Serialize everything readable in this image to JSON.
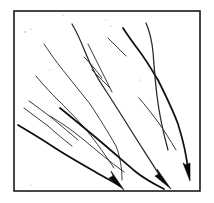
{
  "figure": {
    "background_color": "#ffffff",
    "ink_color": "#262626",
    "frame": {
      "label": "diagram-border",
      "color": "#1a1a1a",
      "stroke_width": 1.6,
      "x": 14,
      "y": 11,
      "width": 186,
      "height": 180
    },
    "networks": [
      {
        "id": "network-left",
        "label": "Left branching network",
        "arrow_label": "arrow-left",
        "arrow_tip": {
          "x": 124,
          "y": 190
        },
        "arrow_angle_deg": 35,
        "branch_count": 5
      },
      {
        "id": "network-center",
        "label": "Center branching network",
        "arrow_label": "arrow-center",
        "arrow_tip": {
          "x": 171,
          "y": 188
        },
        "arrow_angle_deg": 40,
        "branch_count": 6
      },
      {
        "id": "network-right",
        "label": "Right branching network",
        "arrow_label": "arrow-right",
        "arrow_tip": {
          "x": 190,
          "y": 180
        },
        "arrow_angle_deg": 80,
        "branch_count": 4
      }
    ],
    "paths": {
      "left": [
        "M 44 44 C 52 56, 58 64, 66 74 C 74 84, 82 94, 90 104 C 98 116, 108 132, 116 146 C 120 156, 122 168, 122 180",
        "M 36 76 C 44 86, 52 94, 60 102 C 68 110, 78 120, 88 132 C 96 142, 106 156, 114 168",
        "M 29 101 C 36 106, 44 112, 52 118 C 60 125, 70 133, 78 140",
        "M 24 108 C 32 114, 40 120, 48 126 C 56 133, 64 140, 72 146",
        "M 18 125 C 28 131, 40 138, 52 146 C 64 154, 78 162, 92 170 C 102 176, 112 181, 120 186"
      ],
      "center": [
        "M 72 24 C 78 34, 82 44, 86 54 C 90 64, 96 76, 104 88 C 112 100, 122 116, 132 132 C 142 148, 154 166, 164 182",
        "M 88 44 C 92 52, 96 60, 100 68 C 104 76, 108 84, 112 92",
        "M 84 56 C 90 62, 96 70, 102 78",
        "M 92 70 C 98 76, 104 82, 110 88",
        "M 60 108 C 70 116, 82 126, 94 136 C 106 146, 122 160, 136 172 C 146 180, 156 185, 164 188",
        "M 50 116 C 60 122, 72 130, 84 140 C 96 150, 110 162, 124 172"
      ],
      "right": [
        "M 123 28 C 128 36, 134 44, 140 52 C 146 60, 152 70, 158 80 C 164 92, 172 108, 178 124 C 183 140, 187 158, 189 172",
        "M 146 23 C 150 32, 152 42, 153 52 C 154 64, 155 80, 157 96 C 159 112, 163 132, 168 150",
        "M 108 38 C 114 44, 120 50, 126 56",
        "M 139 98 C 146 106, 152 114, 158 122 C 164 130, 170 140, 176 150"
      ]
    },
    "arrowheads": [
      {
        "name": "arrowhead-left",
        "points": "124,190 109,178 113,176 111,171"
      },
      {
        "name": "arrowhead-center",
        "points": "171,189 155,176 159,174 157,169"
      },
      {
        "name": "arrowhead-right",
        "points": "190,181 183,163 186,165 190,163"
      }
    ],
    "specks": [
      {
        "x": 25,
        "y": 32
      },
      {
        "x": 31,
        "y": 29
      },
      {
        "x": 63,
        "y": 15
      },
      {
        "x": 41,
        "y": 46
      },
      {
        "x": 50,
        "y": 70
      },
      {
        "x": 85,
        "y": 62
      },
      {
        "x": 92,
        "y": 64
      },
      {
        "x": 111,
        "y": 26
      },
      {
        "x": 140,
        "y": 80
      },
      {
        "x": 32,
        "y": 101
      },
      {
        "x": 35,
        "y": 105
      },
      {
        "x": 58,
        "y": 101
      },
      {
        "x": 31,
        "y": 185
      },
      {
        "x": 106,
        "y": 20
      }
    ]
  }
}
